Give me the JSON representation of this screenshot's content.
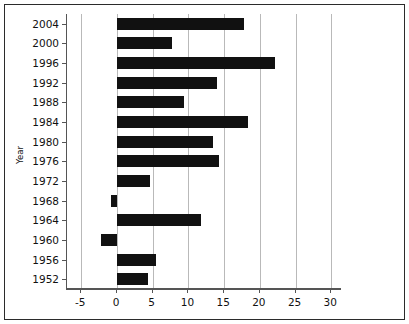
{
  "chart_data": {
    "type": "bar",
    "orientation": "horizontal",
    "title": "",
    "subtitle": "",
    "xlabel": "",
    "ylabel": "Year",
    "categories": [
      "1952",
      "1956",
      "1960",
      "1964",
      "1968",
      "1972",
      "1976",
      "1980",
      "1984",
      "1988",
      "1992",
      "1996",
      "2000",
      "2004"
    ],
    "values": [
      4.3,
      5.5,
      -2.2,
      11.8,
      -0.8,
      4.6,
      14.3,
      13.4,
      18.3,
      9.4,
      14.0,
      22.1,
      7.7,
      17.8
    ],
    "series": [
      {
        "name": "",
        "values": [
          4.3,
          5.5,
          -2.2,
          11.8,
          -0.8,
          4.6,
          14.3,
          13.4,
          18.3,
          9.4,
          14.0,
          22.1,
          7.7,
          17.8
        ]
      }
    ],
    "xlim": [
      -7.0,
      31.5
    ],
    "ylim": [
      0,
      14
    ],
    "xticks": [
      "-5",
      "0",
      "5",
      "10",
      "15",
      "20",
      "25",
      "30"
    ],
    "xtick_values": [
      -5,
      0,
      5,
      10,
      15,
      20,
      25,
      30
    ],
    "yticks": [
      "1952",
      "1956",
      "1960",
      "1964",
      "1968",
      "1972",
      "1976",
      "1980",
      "1984",
      "1988",
      "1992",
      "1996",
      "2000",
      "2004"
    ],
    "grid": "vertical",
    "grid_color": "#b9b9b9",
    "bar_color": "#111111",
    "legend": null,
    "legend_position": "none",
    "annotations": [],
    "frame": true,
    "frame_color": "#2b2b2b",
    "background_color": "#ffffff"
  }
}
